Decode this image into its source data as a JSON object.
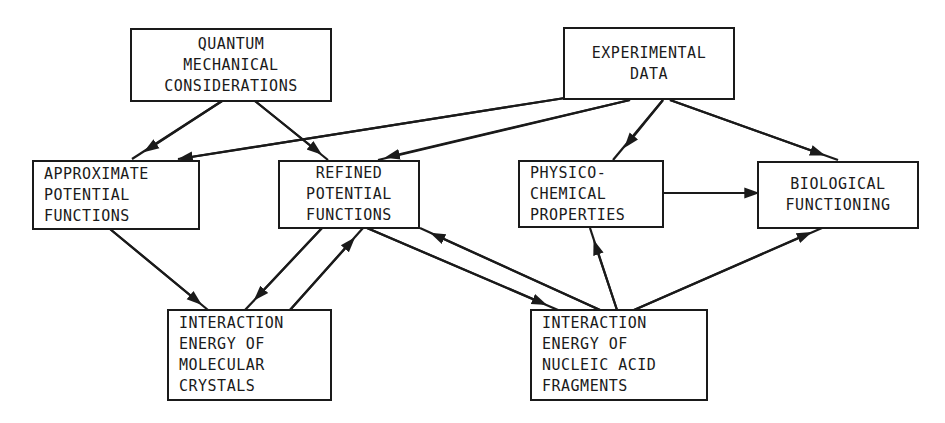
{
  "nodes": {
    "quantum": {
      "lines": [
        "QUANTUM",
        "MECHANICAL",
        "CONSIDERATIONS"
      ]
    },
    "experimental": {
      "lines": [
        "EXPERIMENTAL",
        "DATA"
      ]
    },
    "approximate": {
      "lines": [
        "APPROXIMATE",
        "POTENTIAL",
        "FUNCTIONS"
      ]
    },
    "refined": {
      "lines": [
        "REFINED",
        "POTENTIAL",
        "FUNCTIONS"
      ]
    },
    "physico": {
      "lines": [
        "PHYSICO-",
        "CHEMICAL",
        "PROPERTIES"
      ]
    },
    "biological": {
      "lines": [
        "BIOLOGICAL",
        "FUNCTIONING"
      ]
    },
    "crystals": {
      "lines": [
        "INTERACTION",
        "ENERGY OF",
        "MOLECULAR",
        "CRYSTALS"
      ]
    },
    "nucleic": {
      "lines": [
        "INTERACTION",
        "ENERGY OF",
        "NUCLEIC ACID",
        "FRAGMENTS"
      ]
    }
  },
  "edges": [
    {
      "from": "quantum",
      "to": "approximate"
    },
    {
      "from": "quantum",
      "to": "refined"
    },
    {
      "from": "experimental",
      "to": "approximate"
    },
    {
      "from": "experimental",
      "to": "refined"
    },
    {
      "from": "experimental",
      "to": "physico"
    },
    {
      "from": "experimental",
      "to": "biological"
    },
    {
      "from": "physico",
      "to": "biological"
    },
    {
      "from": "approximate",
      "to": "crystals"
    },
    {
      "from": "refined",
      "to": "crystals"
    },
    {
      "from": "crystals",
      "to": "refined"
    },
    {
      "from": "refined",
      "to": "nucleic"
    },
    {
      "from": "nucleic",
      "to": "refined"
    },
    {
      "from": "nucleic",
      "to": "physico"
    },
    {
      "from": "nucleic",
      "to": "biological"
    }
  ],
  "colors": {
    "ink": "#1a1a1a",
    "background": "#ffffff"
  }
}
